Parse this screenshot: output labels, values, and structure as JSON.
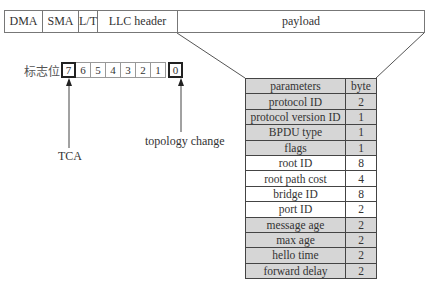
{
  "frame": {
    "fields": [
      {
        "label": "DMA",
        "width": 38
      },
      {
        "label": "SMA",
        "width": 36
      },
      {
        "label": "L/T",
        "width": 19
      },
      {
        "label": "LLC header",
        "width": 80
      },
      {
        "label": "payload",
        "width": 248
      }
    ]
  },
  "flags": {
    "label": "标志位",
    "bits": [
      "7",
      "6",
      "5",
      "4",
      "3",
      "2",
      "1",
      "0"
    ],
    "bit7_label": "TCA",
    "bit0_label": "topology change"
  },
  "table": {
    "header": {
      "name": "parameters",
      "value": "byte"
    },
    "rows": [
      {
        "name": "protocol ID",
        "value": "2",
        "shaded": true
      },
      {
        "name": "protocol version ID",
        "value": "1",
        "shaded": true
      },
      {
        "name": "BPDU type",
        "value": "1",
        "shaded": true
      },
      {
        "name": "flags",
        "value": "1",
        "shaded": true
      },
      {
        "name": "root ID",
        "value": "8",
        "shaded": false
      },
      {
        "name": "root path cost",
        "value": "4",
        "shaded": false
      },
      {
        "name": "bridge ID",
        "value": "8",
        "shaded": false
      },
      {
        "name": "port ID",
        "value": "2",
        "shaded": false
      },
      {
        "name": "message age",
        "value": "2",
        "shaded": true
      },
      {
        "name": "max age",
        "value": "2",
        "shaded": true
      },
      {
        "name": "hello time",
        "value": "2",
        "shaded": true
      },
      {
        "name": "forward delay",
        "value": "2",
        "shaded": true
      }
    ]
  },
  "colors": {
    "shaded_row": "#d6d6d6",
    "line": "#444444"
  }
}
